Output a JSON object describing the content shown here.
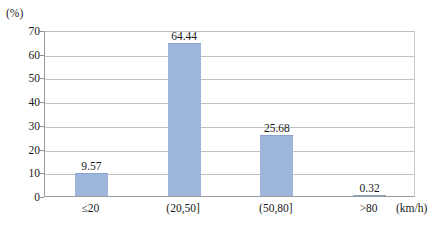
{
  "chart_data": {
    "type": "bar",
    "title": "",
    "subtitle": "",
    "xlabel": "(km/h)",
    "ylabel": "(%)",
    "categories": [
      "≤20",
      "(20,50]",
      "(50,80]",
      ">80"
    ],
    "values": [
      9.57,
      64.44,
      25.68,
      0.32
    ],
    "value_labels": [
      "9.57",
      "64.44",
      "25.68",
      "0.32"
    ],
    "ylim": [
      0,
      70
    ],
    "ytick_values": [
      0,
      10,
      20,
      30,
      40,
      50,
      60,
      70
    ],
    "ytick_labels": [
      "0",
      "10",
      "20",
      "30",
      "40",
      "50",
      "60",
      "70"
    ],
    "grid": "horizontal",
    "legend": "none",
    "series": [
      {
        "name": "speed distribution",
        "values": [
          9.57,
          64.44,
          25.68,
          0.32
        ]
      }
    ]
  },
  "style": {
    "bar_fill": "#9fb6dc",
    "bar_edge": "#8aa4d0",
    "gridline_color": "#c2c2c2",
    "axis_color": "#9a9a9a",
    "text_color": "#1a1a1a",
    "background": "#ffffff"
  }
}
